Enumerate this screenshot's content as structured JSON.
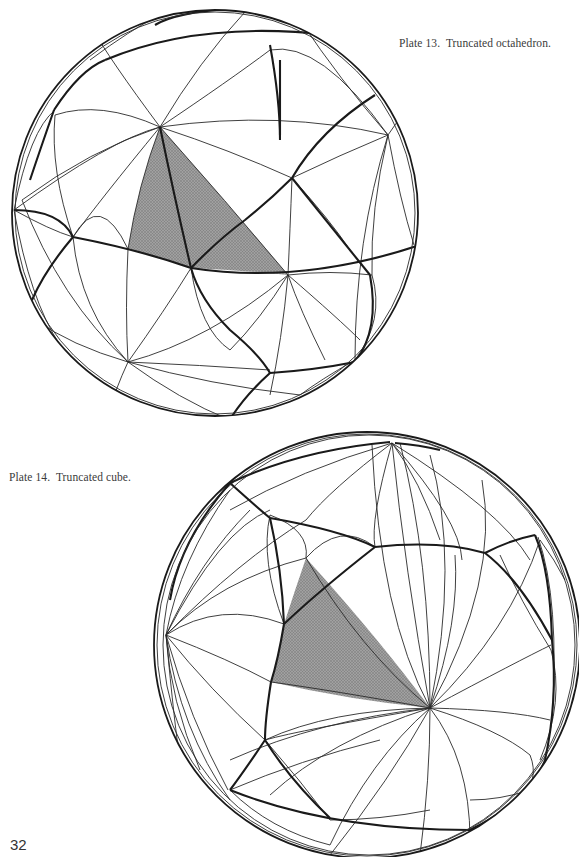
{
  "page": {
    "number": "32",
    "background": "#ffffff"
  },
  "plates": [
    {
      "caption": "Plate 13.  Truncated octahedron.",
      "figure": "spherical-tessellation",
      "shaded_region_color": "#8c8c8c",
      "line_color": "#1a1a1a"
    },
    {
      "caption": "Plate 14.  Truncated cube.",
      "figure": "spherical-tessellation",
      "shaded_region_color": "#8c8c8c",
      "line_color": "#1a1a1a"
    }
  ]
}
